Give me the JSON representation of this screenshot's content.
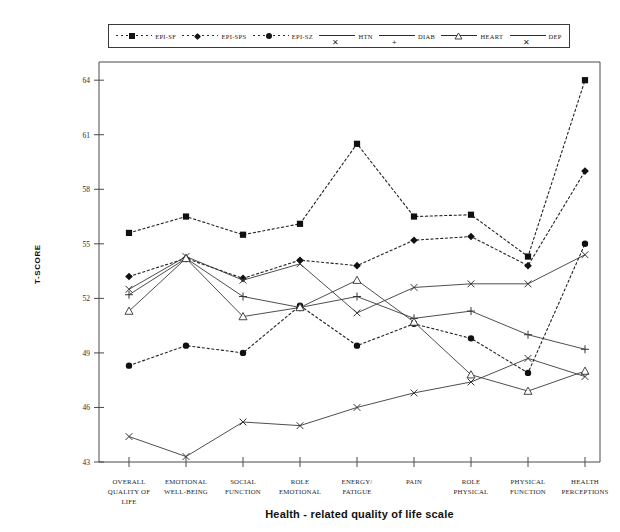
{
  "chart_data": {
    "type": "line",
    "title": "",
    "xlabel": "Health - related quality of life scale",
    "ylabel": "T-SCORE",
    "ylim": [
      43,
      65
    ],
    "yticks": [
      43,
      46,
      49,
      52,
      55,
      58,
      61,
      64
    ],
    "grid": false,
    "legend_position": "top",
    "categories": [
      "OVERALL QUALITY OF LIFE",
      "EMOTIONAL WELL-BEING",
      "SOCIAL FUNCTION",
      "ROLE EMOTIONAL",
      "ENERGY/ FATIGUE",
      "PAIN",
      "ROLE PHYSICAL",
      "PHYSICAL FUNCTION",
      "HEALTH PERCEPTIONS"
    ],
    "category_lines": [
      [
        "OVERALL",
        "QUALITY OF",
        "LIFE"
      ],
      [
        "EMOTIONAL",
        "WELL-BEING"
      ],
      [
        "SOCIAL",
        "FUNCTION"
      ],
      [
        "ROLE",
        "EMOTIONAL"
      ],
      [
        "ENERGY/",
        "FATIGUE"
      ],
      [
        "PAIN"
      ],
      [
        "ROLE",
        "PHYSICAL"
      ],
      [
        "PHYSICAL",
        "FUNCTION"
      ],
      [
        "HEALTH",
        "PERCEPTIONS"
      ]
    ],
    "series": [
      {
        "name": "EPI-SF",
        "marker": "square",
        "style": "dotted",
        "values": [
          55.6,
          56.5,
          55.5,
          56.1,
          60.5,
          56.5,
          56.6,
          54.3,
          64.0
        ]
      },
      {
        "name": "EPI-SPS",
        "marker": "diamond",
        "style": "dotted",
        "values": [
          53.2,
          54.2,
          53.1,
          54.1,
          53.8,
          55.2,
          55.4,
          53.8,
          59.0
        ]
      },
      {
        "name": "EPI-SZ",
        "marker": "circle",
        "style": "dotted",
        "values": [
          48.3,
          49.4,
          49.0,
          51.6,
          49.4,
          50.6,
          49.8,
          47.9,
          55.0
        ]
      },
      {
        "name": "HTN",
        "marker": "x",
        "style": "solid",
        "values": [
          52.5,
          54.3,
          53.0,
          53.9,
          51.2,
          52.6,
          52.8,
          52.8,
          54.4
        ]
      },
      {
        "name": "DIAB",
        "marker": "plus",
        "style": "solid",
        "values": [
          52.2,
          54.2,
          52.1,
          51.5,
          52.1,
          50.9,
          51.3,
          50.0,
          49.2
        ]
      },
      {
        "name": "HEART",
        "marker": "triangle",
        "style": "solid",
        "values": [
          51.3,
          54.2,
          51.0,
          51.5,
          53.0,
          50.7,
          47.8,
          46.9,
          48.0
        ]
      },
      {
        "name": "DEP",
        "marker": "x",
        "style": "solid",
        "values": [
          44.4,
          43.3,
          45.2,
          45.0,
          46.0,
          46.8,
          47.4,
          48.7,
          47.7
        ]
      }
    ]
  },
  "legend": {
    "items": [
      {
        "label": "EPI-SF",
        "marker": "square",
        "style": "dotted"
      },
      {
        "label": "EPI-SPS",
        "marker": "diamond",
        "style": "dotted"
      },
      {
        "label": "EPI-SZ",
        "marker": "circle",
        "style": "dotted"
      },
      {
        "label": "HTN",
        "marker": "x",
        "style": "solid"
      },
      {
        "label": "DIAB",
        "marker": "plus",
        "style": "solid"
      },
      {
        "label": "HEART",
        "marker": "triangle",
        "style": "solid"
      },
      {
        "label": "DEP",
        "marker": "x",
        "style": "solid"
      }
    ]
  },
  "colors": {
    "line": "#2b2b2b",
    "axis": "#4a4a4a",
    "background": "#ffffff",
    "marker_fill": "#101010"
  }
}
